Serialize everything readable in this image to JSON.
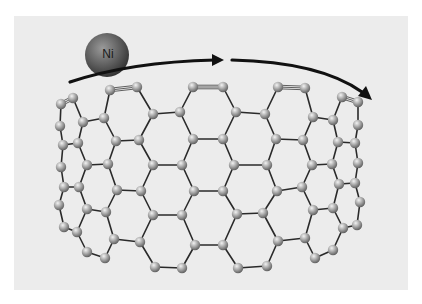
{
  "figure": {
    "panel": {
      "x": 14,
      "y": 16,
      "width": 394,
      "height": 274,
      "color": "#ececec"
    },
    "colors": {
      "carbon_light": "#d8d8d8",
      "carbon_mid": "#a6a6a6",
      "carbon_dark": "#6e6e6e",
      "bond": "#2a2a2a",
      "nickel_light": "#8c8c8c",
      "nickel_dark": "#3e3e3e",
      "arrow": "#111111"
    },
    "nickel": {
      "label": "Ni",
      "cx": 107,
      "cy": 55,
      "r": 22
    },
    "arrows": [
      {
        "name": "arrow-left-segment",
        "path": "M 70 82 Q 130 62 215 60",
        "head": [
          [
            224,
            60
          ],
          [
            212,
            54
          ],
          [
            212,
            66
          ]
        ]
      },
      {
        "name": "arrow-right-segment",
        "path": "M 232 60 Q 320 62 362 92",
        "head": [
          [
            372,
            100
          ],
          [
            358,
            96
          ],
          [
            366,
            86
          ]
        ]
      }
    ],
    "atom_radius": 5.2,
    "rows": {
      "A": [
        [
          61,
          104
        ],
        [
          73,
          98
        ],
        [
          110,
          90
        ],
        [
          137,
          87
        ],
        [
          193,
          87
        ],
        [
          223,
          87
        ],
        [
          278,
          87
        ],
        [
          305,
          88
        ],
        [
          342,
          97
        ],
        [
          358,
          102
        ]
      ],
      "B": [
        [
          60,
          126
        ],
        [
          83,
          122
        ],
        [
          104,
          118
        ],
        [
          153,
          114
        ],
        [
          180,
          112
        ],
        [
          236,
          112
        ],
        [
          265,
          114
        ],
        [
          313,
          117
        ],
        [
          333,
          120
        ],
        [
          358,
          125
        ]
      ],
      "C": [
        [
          63,
          145
        ],
        [
          78,
          143
        ],
        [
          116,
          141
        ],
        [
          139,
          140
        ],
        [
          193,
          139
        ],
        [
          223,
          139
        ],
        [
          276,
          139
        ],
        [
          303,
          140
        ],
        [
          338,
          142
        ],
        [
          355,
          143
        ]
      ],
      "D": [
        [
          61,
          167
        ],
        [
          87,
          165
        ],
        [
          108,
          164
        ],
        [
          153,
          165
        ],
        [
          182,
          165
        ],
        [
          234,
          165
        ],
        [
          267,
          165
        ],
        [
          312,
          165
        ],
        [
          332,
          164
        ],
        [
          358,
          163
        ]
      ],
      "E": [
        [
          64,
          187
        ],
        [
          79,
          187
        ],
        [
          117,
          190
        ],
        [
          141,
          191
        ],
        [
          194,
          191
        ],
        [
          223,
          191
        ],
        [
          277,
          191
        ],
        [
          302,
          187
        ],
        [
          339,
          184
        ],
        [
          355,
          183
        ]
      ],
      "F": [
        [
          59,
          205
        ],
        [
          87,
          209
        ],
        [
          106,
          212
        ],
        [
          153,
          215
        ],
        [
          182,
          215
        ],
        [
          237,
          214
        ],
        [
          263,
          213
        ],
        [
          313,
          210
        ],
        [
          333,
          208
        ],
        [
          360,
          202
        ]
      ],
      "G": [
        [
          64,
          227
        ],
        [
          77,
          232
        ],
        [
          114,
          239
        ],
        [
          140,
          242
        ],
        [
          195,
          245
        ],
        [
          223,
          245
        ],
        [
          278,
          241
        ],
        [
          305,
          238
        ],
        [
          343,
          228
        ],
        [
          357,
          225
        ]
      ],
      "H": [
        [
          87,
          252
        ],
        [
          105,
          258
        ],
        [
          155,
          267
        ],
        [
          182,
          268
        ],
        [
          238,
          268
        ],
        [
          267,
          266
        ],
        [
          315,
          258
        ],
        [
          333,
          250
        ]
      ]
    },
    "triple_bonds": [
      [
        "A",
        0,
        "A",
        1
      ],
      [
        "A",
        2,
        "A",
        3
      ],
      [
        "A",
        4,
        "A",
        5
      ],
      [
        "A",
        6,
        "A",
        7
      ],
      [
        "A",
        8,
        "A",
        9
      ]
    ],
    "bonds": [
      [
        "A",
        0,
        "B",
        0
      ],
      [
        "A",
        1,
        "B",
        1
      ],
      [
        "A",
        2,
        "B",
        2
      ],
      [
        "A",
        3,
        "B",
        3
      ],
      [
        "A",
        4,
        "B",
        4
      ],
      [
        "A",
        5,
        "B",
        5
      ],
      [
        "A",
        6,
        "B",
        6
      ],
      [
        "A",
        7,
        "B",
        7
      ],
      [
        "A",
        8,
        "B",
        8
      ],
      [
        "A",
        9,
        "B",
        9
      ],
      [
        "B",
        1,
        "B",
        2
      ],
      [
        "B",
        3,
        "B",
        4
      ],
      [
        "B",
        5,
        "B",
        6
      ],
      [
        "B",
        7,
        "B",
        8
      ],
      [
        "B",
        0,
        "C",
        0
      ],
      [
        "B",
        1,
        "C",
        1
      ],
      [
        "B",
        2,
        "C",
        2
      ],
      [
        "B",
        3,
        "C",
        3
      ],
      [
        "B",
        4,
        "C",
        4
      ],
      [
        "B",
        5,
        "C",
        5
      ],
      [
        "B",
        6,
        "C",
        6
      ],
      [
        "B",
        7,
        "C",
        7
      ],
      [
        "B",
        8,
        "C",
        8
      ],
      [
        "B",
        9,
        "C",
        9
      ],
      [
        "C",
        0,
        "C",
        1
      ],
      [
        "C",
        2,
        "C",
        3
      ],
      [
        "C",
        4,
        "C",
        5
      ],
      [
        "C",
        6,
        "C",
        7
      ],
      [
        "C",
        8,
        "C",
        9
      ],
      [
        "C",
        0,
        "D",
        0
      ],
      [
        "C",
        1,
        "D",
        1
      ],
      [
        "C",
        2,
        "D",
        2
      ],
      [
        "C",
        3,
        "D",
        3
      ],
      [
        "C",
        4,
        "D",
        4
      ],
      [
        "C",
        5,
        "D",
        5
      ],
      [
        "C",
        6,
        "D",
        6
      ],
      [
        "C",
        7,
        "D",
        7
      ],
      [
        "C",
        8,
        "D",
        8
      ],
      [
        "C",
        9,
        "D",
        9
      ],
      [
        "D",
        1,
        "D",
        2
      ],
      [
        "D",
        3,
        "D",
        4
      ],
      [
        "D",
        5,
        "D",
        6
      ],
      [
        "D",
        7,
        "D",
        8
      ],
      [
        "D",
        0,
        "E",
        0
      ],
      [
        "D",
        1,
        "E",
        1
      ],
      [
        "D",
        2,
        "E",
        2
      ],
      [
        "D",
        3,
        "E",
        3
      ],
      [
        "D",
        4,
        "E",
        4
      ],
      [
        "D",
        5,
        "E",
        5
      ],
      [
        "D",
        6,
        "E",
        6
      ],
      [
        "D",
        7,
        "E",
        7
      ],
      [
        "D",
        8,
        "E",
        8
      ],
      [
        "D",
        9,
        "E",
        9
      ],
      [
        "E",
        0,
        "E",
        1
      ],
      [
        "E",
        2,
        "E",
        3
      ],
      [
        "E",
        4,
        "E",
        5
      ],
      [
        "E",
        6,
        "E",
        7
      ],
      [
        "E",
        8,
        "E",
        9
      ],
      [
        "E",
        0,
        "F",
        0
      ],
      [
        "E",
        1,
        "F",
        1
      ],
      [
        "E",
        2,
        "F",
        2
      ],
      [
        "E",
        3,
        "F",
        3
      ],
      [
        "E",
        4,
        "F",
        4
      ],
      [
        "E",
        5,
        "F",
        5
      ],
      [
        "E",
        6,
        "F",
        6
      ],
      [
        "E",
        7,
        "F",
        7
      ],
      [
        "E",
        8,
        "F",
        8
      ],
      [
        "E",
        9,
        "F",
        9
      ],
      [
        "F",
        1,
        "F",
        2
      ],
      [
        "F",
        3,
        "F",
        4
      ],
      [
        "F",
        5,
        "F",
        6
      ],
      [
        "F",
        7,
        "F",
        8
      ],
      [
        "F",
        0,
        "G",
        0
      ],
      [
        "F",
        1,
        "G",
        1
      ],
      [
        "F",
        2,
        "G",
        2
      ],
      [
        "F",
        3,
        "G",
        3
      ],
      [
        "F",
        4,
        "G",
        4
      ],
      [
        "F",
        5,
        "G",
        5
      ],
      [
        "F",
        6,
        "G",
        6
      ],
      [
        "F",
        7,
        "G",
        7
      ],
      [
        "F",
        8,
        "G",
        8
      ],
      [
        "F",
        9,
        "G",
        9
      ],
      [
        "G",
        0,
        "G",
        1
      ],
      [
        "G",
        2,
        "G",
        3
      ],
      [
        "G",
        4,
        "G",
        5
      ],
      [
        "G",
        6,
        "G",
        7
      ],
      [
        "G",
        8,
        "G",
        9
      ],
      [
        "G",
        1,
        "H",
        0
      ],
      [
        "H",
        0,
        "H",
        1
      ],
      [
        "H",
        1,
        "G",
        2
      ],
      [
        "G",
        3,
        "H",
        2
      ],
      [
        "H",
        2,
        "H",
        3
      ],
      [
        "H",
        3,
        "G",
        4
      ],
      [
        "G",
        5,
        "H",
        4
      ],
      [
        "H",
        4,
        "H",
        5
      ],
      [
        "H",
        5,
        "G",
        6
      ],
      [
        "G",
        7,
        "H",
        6
      ],
      [
        "H",
        6,
        "H",
        7
      ],
      [
        "H",
        7,
        "G",
        8
      ]
    ]
  }
}
